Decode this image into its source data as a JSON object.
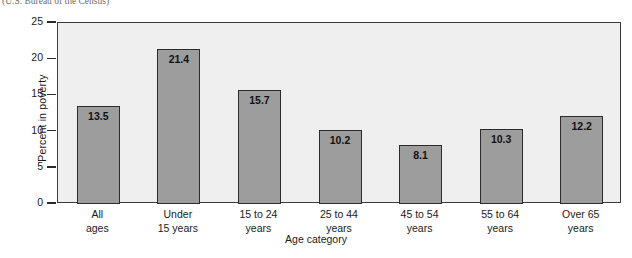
{
  "caption": {
    "text": "(U.S. Bureau of the Census)"
  },
  "chart_data": {
    "type": "bar",
    "title": "",
    "subtitle": "",
    "xlabel": "Age category",
    "ylabel": "Percent in poverty",
    "categories": [
      "All ages",
      "Under 15 years",
      "15 to 24 years",
      "25 to 44 years",
      "45 to 54 years",
      "55 to 64 years",
      "Over 65 years"
    ],
    "category_lines": [
      [
        "All",
        "ages"
      ],
      [
        "Under",
        "15 years"
      ],
      [
        "15 to 24",
        "years"
      ],
      [
        "25 to 44",
        "years"
      ],
      [
        "45 to 54",
        "years"
      ],
      [
        "55 to 64",
        "years"
      ],
      [
        "Over 65",
        "years"
      ]
    ],
    "values": [
      13.5,
      21.4,
      15.7,
      10.2,
      8.1,
      10.3,
      12.2
    ],
    "value_labels": [
      "13.5",
      "21.4",
      "15.7",
      "10.2",
      "8.1",
      "10.3",
      "12.2"
    ],
    "ylim": [
      0,
      25
    ],
    "yticks": [
      0,
      5,
      10,
      15,
      20,
      25
    ],
    "ytick_labels": [
      "0",
      "5",
      "10",
      "15",
      "20",
      "25"
    ],
    "grid": false,
    "legend": null,
    "colors": {
      "bar_fill": "#9d9d9d",
      "bar_edge": "#2b2b2b",
      "plot_background": "#efefef",
      "axis": "#3a3a3a",
      "text": "#1a1a1a"
    }
  }
}
